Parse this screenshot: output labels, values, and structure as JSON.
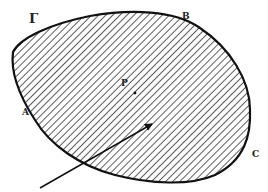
{
  "diagram": {
    "region_name": "Γ",
    "labels": {
      "boundary": "Γ",
      "point_a": "A",
      "point_b": "B",
      "point_c": "C",
      "point_p": "P"
    },
    "colors": {
      "stroke": "#111111",
      "hatch": "#333333",
      "background": "#ffffff"
    },
    "elements": [
      {
        "type": "closed-curve",
        "description": "hatched region bounded by curve Γ"
      },
      {
        "type": "point",
        "label": "P",
        "description": "interior point marked with dot"
      },
      {
        "type": "arrow",
        "description": "arrow entering region from lower-left, pointing toward interior"
      }
    ]
  }
}
